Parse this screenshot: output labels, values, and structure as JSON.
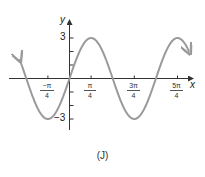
{
  "chart_data": {
    "type": "line",
    "function": "y = 3 sin(2x)",
    "title": "",
    "xlabel": "x",
    "ylabel": "y",
    "caption": "(J)",
    "x_ticks": [
      {
        "value": -0.7854,
        "label_num": "−π",
        "label_den": "4",
        "label": "−π/4"
      },
      {
        "value": 0.7854,
        "label_num": "π",
        "label_den": "4",
        "label": "π/4"
      },
      {
        "value": 2.3562,
        "label_num": "3π",
        "label_den": "4",
        "label": "3π/4"
      },
      {
        "value": 3.927,
        "label_num": "5π",
        "label_den": "4",
        "label": "5π/4"
      }
    ],
    "y_ticks": [
      -3,
      -2,
      -1,
      1,
      2,
      3
    ],
    "y_tick_labels": {
      "top": "3",
      "bottom": "−3"
    },
    "xlim": [
      -1.85,
      4.5
    ],
    "ylim": [
      -3.8,
      4.3
    ],
    "amplitude": 3,
    "period": 3.1416,
    "key_points": [
      {
        "x": -1.5708,
        "y": 0
      },
      {
        "x": -0.7854,
        "y": -3
      },
      {
        "x": 0,
        "y": 0
      },
      {
        "x": 0.7854,
        "y": 3
      },
      {
        "x": 1.5708,
        "y": 0
      },
      {
        "x": 2.3562,
        "y": -3
      },
      {
        "x": 3.1416,
        "y": 0
      },
      {
        "x": 3.927,
        "y": 3
      }
    ],
    "curve_color": "#9a9a9a",
    "axis_color": "#333333",
    "grid": false,
    "legend": null
  }
}
